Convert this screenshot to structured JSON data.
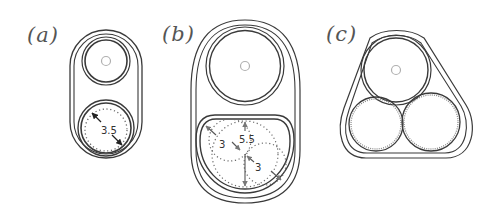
{
  "figure": {
    "panels": [
      {
        "id": "a",
        "label": "(a)",
        "description": "Capsule enclosure with one plain circle on top and one circle containing a dotted inner circle with diameter 3.5",
        "dimensions": [
          {
            "value": "3.5"
          }
        ]
      },
      {
        "id": "b",
        "label": "(b)",
        "description": "Larger capsule enclosure with plain circle on top and rounded compartment holding overlapping dotted circles",
        "dimensions": [
          {
            "value": "3"
          },
          {
            "value": "5.5"
          },
          {
            "value": "3"
          }
        ]
      },
      {
        "id": "c",
        "label": "(c)",
        "description": "Rounded triangular enclosure holding three circles: one plain on top, two dotted-edge circles below"
      }
    ],
    "colors": {
      "stroke": "#3a3a3a",
      "stroke_light": "#8a8a8a",
      "dotted": "#6a6a6a",
      "center_mark": "#b0b0b0",
      "label": "#555555",
      "background": "#ffffff"
    }
  }
}
